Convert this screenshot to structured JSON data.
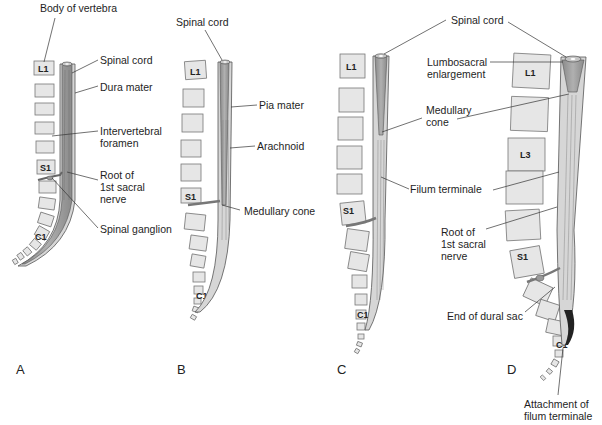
{
  "figure": {
    "colors": {
      "background": "#ffffff",
      "vertebra_fill": "#e6e6e6",
      "vertebra_stroke": "#777777",
      "cord_fill": "#9a9a9a",
      "dura_fill": "#d6d6d6",
      "line": "#333333"
    },
    "panels": [
      {
        "id": "A",
        "letter": "A",
        "vertebra_labels": [
          "L1",
          "S1",
          "C1"
        ],
        "labels": {
          "body_of_vertebra": "Body of vertebra",
          "spinal_cord": "Spinal cord",
          "dura_mater": "Dura mater",
          "intervertebral_foramen": "Intervertebral\nforamen",
          "root_sacral": "Root of\n1st sacral\nnerve",
          "spinal_ganglion": "Spinal ganglion"
        }
      },
      {
        "id": "B",
        "letter": "B",
        "vertebra_labels": [
          "L1",
          "S1",
          "C1"
        ],
        "labels": {
          "spinal_cord": "Spinal cord",
          "pia_mater": "Pia mater",
          "arachnoid": "Arachnoid",
          "medullary_cone": "Medullary cone"
        }
      },
      {
        "id": "C",
        "letter": "C",
        "vertebra_labels": [
          "L1",
          "S1",
          "C1"
        ],
        "labels": {
          "medullary_cone": "Medullary\ncone",
          "filum_terminale": "Filum terminale"
        }
      },
      {
        "id": "D",
        "letter": "D",
        "vertebra_labels": [
          "L1",
          "L3",
          "S1",
          "C1"
        ],
        "labels": {
          "spinal_cord": "Spinal cord",
          "lumbosacral_enlargement": "Lumbosacral\nenlargement",
          "root_sacral": "Root of\n1st sacral\nnerve",
          "end_of_dural_sac": "End of dural sac",
          "attachment_filum": "Attachment of\nfilum terminale"
        }
      }
    ]
  }
}
